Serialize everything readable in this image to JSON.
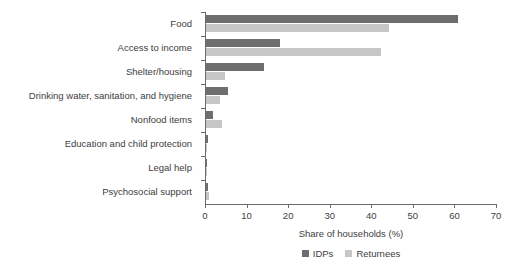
{
  "chart_data": {
    "type": "bar",
    "orientation": "horizontal",
    "title": "",
    "xlabel": "Share of households (%)",
    "ylabel": "",
    "xlim": [
      0,
      70
    ],
    "xticks": [
      0,
      10,
      20,
      30,
      40,
      50,
      60,
      70
    ],
    "grid": false,
    "legend_position": "bottom-center",
    "categories": [
      "Food",
      "Access to income",
      "Shelter/housing",
      "Drinking water, sanitation, and hygiene",
      "Nonfood items",
      "Education and child protection",
      "Legal help",
      "Psychosocial support"
    ],
    "series": [
      {
        "name": "IDPs",
        "color": "#6e6e6e",
        "values": [
          60.6,
          17.8,
          14.0,
          5.2,
          1.7,
          0.4,
          0.3,
          0.4
        ]
      },
      {
        "name": "Returnees",
        "color": "#c6c6c6",
        "values": [
          44.0,
          42.0,
          4.6,
          3.3,
          3.9,
          0.2,
          0.1,
          0.7
        ]
      }
    ]
  },
  "axis": {
    "x_title": "Share of households (%)",
    "tick_labels": [
      "0",
      "10",
      "20",
      "30",
      "40",
      "50",
      "60",
      "70"
    ]
  },
  "legend": {
    "items": [
      {
        "label": "IDPs",
        "color": "#6e6e6e"
      },
      {
        "label": "Returnees",
        "color": "#c6c6c6"
      }
    ]
  },
  "colors": {
    "idp": "#6e6e6e",
    "returnee": "#c6c6c6",
    "axis": "#6b6b6b",
    "text": "#3d3d3d",
    "background": "#ffffff"
  }
}
